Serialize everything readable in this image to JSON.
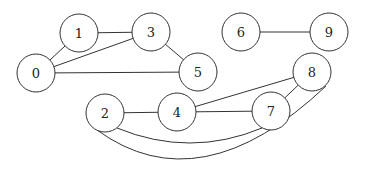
{
  "diagram": {
    "type": "undirected-graph",
    "node_radius": 19,
    "nodes": [
      {
        "id": "0",
        "label": "0",
        "x": 36,
        "y": 73
      },
      {
        "id": "1",
        "label": "1",
        "x": 79,
        "y": 33
      },
      {
        "id": "2",
        "label": "2",
        "x": 105,
        "y": 113
      },
      {
        "id": "3",
        "label": "3",
        "x": 151,
        "y": 32
      },
      {
        "id": "4",
        "label": "4",
        "x": 177,
        "y": 112
      },
      {
        "id": "5",
        "label": "5",
        "x": 198,
        "y": 72
      },
      {
        "id": "6",
        "label": "6",
        "x": 241,
        "y": 32
      },
      {
        "id": "7",
        "label": "7",
        "x": 271,
        "y": 111
      },
      {
        "id": "8",
        "label": "8",
        "x": 312,
        "y": 72
      },
      {
        "id": "9",
        "label": "9",
        "x": 329,
        "y": 32
      }
    ],
    "edges": [
      {
        "source": "0",
        "target": "1",
        "style": "straight"
      },
      {
        "source": "1",
        "target": "3",
        "style": "straight"
      },
      {
        "source": "0",
        "target": "3",
        "style": "straight"
      },
      {
        "source": "3",
        "target": "5",
        "style": "straight"
      },
      {
        "source": "0",
        "target": "5",
        "style": "straight"
      },
      {
        "source": "6",
        "target": "9",
        "style": "straight"
      },
      {
        "source": "2",
        "target": "4",
        "style": "straight"
      },
      {
        "source": "4",
        "target": "7",
        "style": "straight"
      },
      {
        "source": "4",
        "target": "8",
        "style": "straight"
      },
      {
        "source": "7",
        "target": "8",
        "style": "straight"
      },
      {
        "source": "2",
        "target": "7",
        "style": "curved",
        "path": "M 117 128 Q 190 158 262 128"
      },
      {
        "source": "2",
        "target": "8",
        "style": "curved",
        "path": "M 97 130 Q 200 205 326 86"
      }
    ]
  }
}
